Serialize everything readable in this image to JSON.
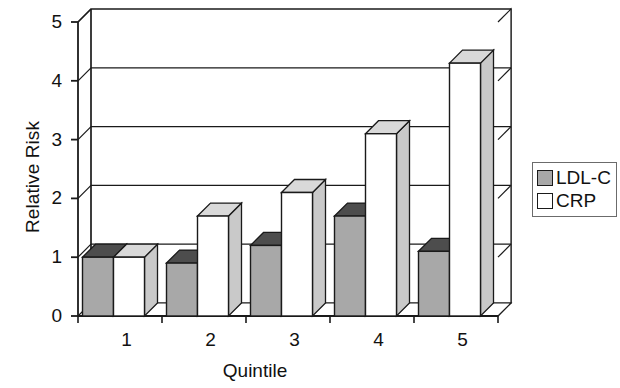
{
  "chart_data": {
    "type": "bar",
    "title": "",
    "subtitle": "",
    "xlabel": "Quintile",
    "ylabel": "Relative Risk",
    "categories": [
      "1",
      "2",
      "3",
      "4",
      "5"
    ],
    "series": [
      {
        "name": "LDL-C",
        "values": [
          1.0,
          0.9,
          1.2,
          1.7,
          1.1
        ],
        "color": "#a8a8a8"
      },
      {
        "name": "CRP",
        "values": [
          1.0,
          1.7,
          2.1,
          3.1,
          4.3
        ],
        "color": "#ffffff"
      }
    ],
    "ylim": [
      0,
      5
    ],
    "yticks": [
      0,
      1,
      2,
      3,
      4,
      5
    ],
    "ytick_labels": [
      "0",
      "1",
      "2",
      "3",
      "4",
      "5"
    ],
    "grid": true,
    "grid_axis": "y",
    "legend_position": "right",
    "projection": "3d",
    "style": "grayscale"
  },
  "legend": {
    "entries": [
      {
        "label": "LDL-C",
        "swatch": "#a8a8a8"
      },
      {
        "label": "CRP",
        "swatch": "#ffffff"
      }
    ]
  }
}
